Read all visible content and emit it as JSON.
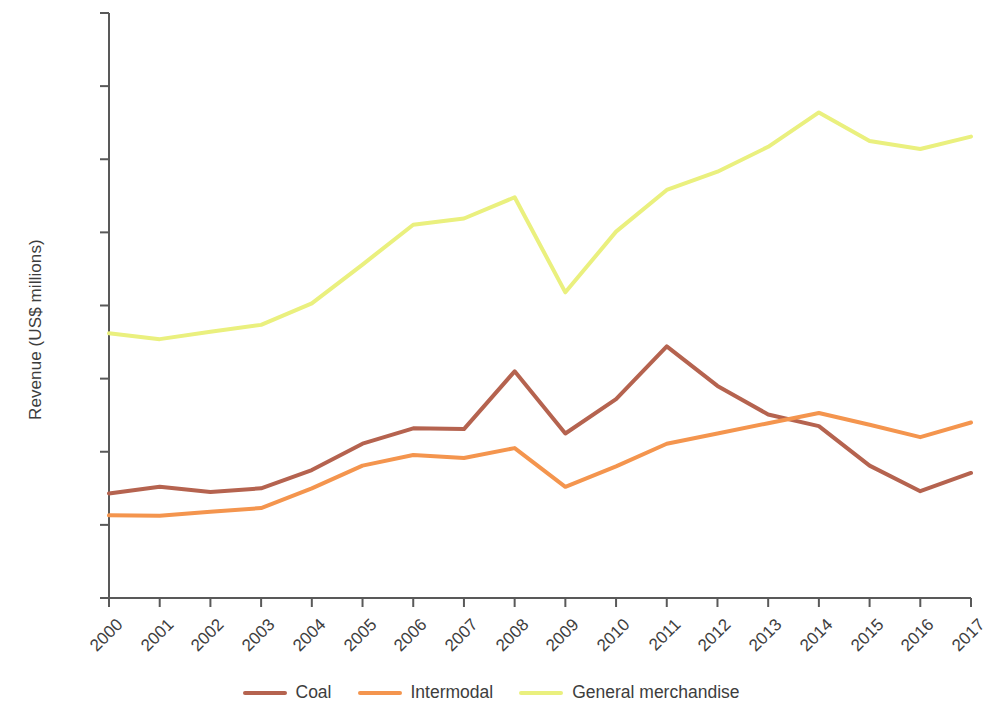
{
  "chart_data": {
    "type": "line",
    "title": "",
    "xlabel": "",
    "ylabel": "Revenue (US$ millions)",
    "categories": [
      "2000",
      "2001",
      "2002",
      "2003",
      "2004",
      "2005",
      "2006",
      "2007",
      "2008",
      "2009",
      "2010",
      "2011",
      "2012",
      "2013",
      "2014",
      "2015",
      "2016",
      "2017"
    ],
    "x": [
      2000,
      2001,
      2002,
      2003,
      2004,
      2005,
      2006,
      2007,
      2008,
      2009,
      2010,
      2011,
      2012,
      2013,
      2014,
      2015,
      2016,
      2017
    ],
    "ylim": [
      0,
      8000
    ],
    "yticks": [
      0,
      1000,
      2000,
      3000,
      4000,
      5000,
      6000,
      7000,
      8000
    ],
    "ytick_labels": [
      "0",
      "1,000",
      "2,000",
      "3,000",
      "4,000",
      "5,000",
      "6,000",
      "7,000",
      "8,000"
    ],
    "grid": false,
    "legend_position": "bottom",
    "series": [
      {
        "name": "Coal",
        "color": "#b5634f",
        "values": [
          1430,
          1520,
          1450,
          1500,
          1750,
          2110,
          2320,
          2310,
          3100,
          2250,
          2720,
          3440,
          2900,
          2510,
          2350,
          1810,
          1460,
          1710
        ]
      },
      {
        "name": "Intermodal",
        "color": "#f4954e",
        "values": [
          1130,
          1125,
          1180,
          1230,
          1500,
          1810,
          1955,
          1915,
          2050,
          1520,
          1800,
          2110,
          2250,
          2390,
          2530,
          2370,
          2200,
          2400
        ]
      },
      {
        "name": "General merchandise",
        "color": "#eaf07e",
        "values": [
          3620,
          3540,
          3640,
          3735,
          4030,
          4560,
          5105,
          5190,
          5480,
          4180,
          5010,
          5580,
          5830,
          6170,
          6640,
          6250,
          6140,
          6310
        ]
      }
    ]
  },
  "legend": {
    "items": [
      {
        "label": "Coal",
        "color": "#b5634f"
      },
      {
        "label": "Intermodal",
        "color": "#f4954e"
      },
      {
        "label": "General merchandise",
        "color": "#eaf07e"
      }
    ]
  },
  "axes": {
    "y_title": "Revenue (US$ millions)",
    "axis_color": "#595959"
  }
}
